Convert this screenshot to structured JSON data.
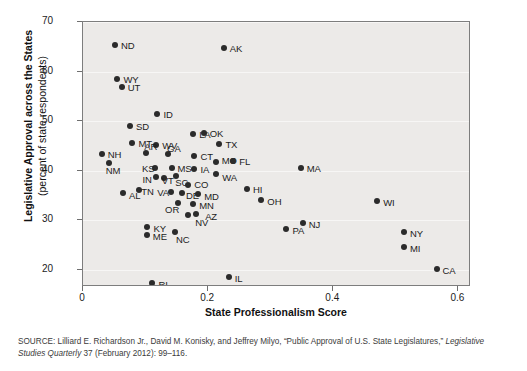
{
  "figure": {
    "xlabel": "State Professionalism Score",
    "ylabel_line1": "Legislative Approval across the States",
    "ylabel_line2": "(percent of state respondents)",
    "source_prefix": "SOURCE:",
    "source_text": " Lilliard E. Richardson Jr., David M. Konisky, and Jeffrey Milyo, “Public Approval of U.S. State Legislatures,” ",
    "source_italic": "Legislative Studies Quarterly",
    "source_suffix": " 37 (February 2012): 99–116.",
    "point_color": "#2b2b2b",
    "plot_background": "#eceae8",
    "border_color": "#7d7d7d"
  },
  "chart_data": {
    "type": "scatter",
    "title": "",
    "xlabel": "State Professionalism Score",
    "ylabel": "Legislative Approval across the States (percent of state respondents)",
    "xlim": [
      0.0,
      0.62
    ],
    "ylim": [
      16.5,
      70.0
    ],
    "xticks": [
      0,
      0.2,
      0.4,
      0.6
    ],
    "xticklabels": [
      "0",
      "0.2",
      "0.4",
      "0.6"
    ],
    "yticks": [
      20,
      30,
      40,
      50,
      60,
      70
    ],
    "yticklabels": [
      "20",
      "30",
      "40",
      "50",
      "60",
      "70"
    ],
    "grid": true,
    "legend": null,
    "points": [
      {
        "label": "ND",
        "x": 0.051,
        "y": 65.4,
        "lx": 6,
        "ly": -5
      },
      {
        "label": "AK",
        "x": 0.225,
        "y": 64.8,
        "lx": 6,
        "ly": -5
      },
      {
        "label": "WY",
        "x": 0.055,
        "y": 58.4,
        "lx": 6,
        "ly": -5
      },
      {
        "label": "UT",
        "x": 0.062,
        "y": 56.9,
        "lx": 6,
        "ly": -5
      },
      {
        "label": "ID",
        "x": 0.119,
        "y": 51.4,
        "lx": 6,
        "ly": -5
      },
      {
        "label": "SD",
        "x": 0.075,
        "y": 49.0,
        "lx": 6,
        "ly": -5
      },
      {
        "label": "LA",
        "x": 0.176,
        "y": 47.3,
        "lx": 6,
        "ly": -5
      },
      {
        "label": "OK",
        "x": 0.193,
        "y": 47.5,
        "lx": 6,
        "ly": -5
      },
      {
        "label": "TX",
        "x": 0.218,
        "y": 45.4,
        "lx": 6,
        "ly": -5
      },
      {
        "label": "MT",
        "x": 0.079,
        "y": 45.6,
        "lx": 6,
        "ly": -5
      },
      {
        "label": "WV",
        "x": 0.117,
        "y": 45.2,
        "lx": 6,
        "ly": -5
      },
      {
        "label": "NH",
        "x": 0.03,
        "y": 43.3,
        "lx": 6,
        "ly": -5
      },
      {
        "label": "AR",
        "x": 0.101,
        "y": 43.6,
        "lx": -2,
        "ly": -12
      },
      {
        "label": "GA",
        "x": 0.136,
        "y": 43.3,
        "lx": -1,
        "ly": -11
      },
      {
        "label": "CT",
        "x": 0.178,
        "y": 43.0,
        "lx": 6,
        "ly": -5
      },
      {
        "label": "MO",
        "x": 0.212,
        "y": 41.8,
        "lx": 6,
        "ly": -7
      },
      {
        "label": "FL",
        "x": 0.24,
        "y": 42.0,
        "lx": 6,
        "ly": -5
      },
      {
        "label": "NM",
        "x": 0.041,
        "y": 41.6,
        "lx": -3,
        "ly": 2
      },
      {
        "label": "KS",
        "x": 0.115,
        "y": 40.6,
        "lx": -13,
        "ly": -5
      },
      {
        "label": "MS",
        "x": 0.143,
        "y": 40.5,
        "lx": 5,
        "ly": -5
      },
      {
        "label": "IA",
        "x": 0.178,
        "y": 40.3,
        "lx": 6,
        "ly": -5
      },
      {
        "label": "WA",
        "x": 0.213,
        "y": 39.4,
        "lx": 6,
        "ly": -2
      },
      {
        "label": "IN",
        "x": 0.116,
        "y": 38.8,
        "lx": -13,
        "ly": -3
      },
      {
        "label": "VT",
        "x": 0.129,
        "y": 38.6,
        "lx": -2,
        "ly": -3
      },
      {
        "label": "SC",
        "x": 0.149,
        "y": 38.9,
        "lx": -1,
        "ly": 1
      },
      {
        "label": "MA",
        "x": 0.348,
        "y": 40.5,
        "lx": 6,
        "ly": -5
      },
      {
        "label": "CO",
        "x": 0.168,
        "y": 37.0,
        "lx": 6,
        "ly": -6
      },
      {
        "label": "HI",
        "x": 0.262,
        "y": 36.2,
        "lx": 6,
        "ly": -5
      },
      {
        "label": "AL",
        "x": 0.064,
        "y": 35.5,
        "lx": 6,
        "ly": -3
      },
      {
        "label": "TN",
        "x": 0.09,
        "y": 36.1,
        "lx": 2,
        "ly": -4
      },
      {
        "label": "VA",
        "x": 0.141,
        "y": 35.6,
        "lx": -14,
        "ly": 0
      },
      {
        "label": "DE",
        "x": 0.158,
        "y": 35.4,
        "lx": 4,
        "ly": -3
      },
      {
        "label": "MD",
        "x": 0.184,
        "y": 35.2,
        "lx": 6,
        "ly": -3
      },
      {
        "label": "OH",
        "x": 0.285,
        "y": 34.0,
        "lx": 6,
        "ly": -4
      },
      {
        "label": "WI",
        "x": 0.47,
        "y": 33.9,
        "lx": 6,
        "ly": -4
      },
      {
        "label": "OR",
        "x": 0.152,
        "y": 33.5,
        "lx": -13,
        "ly": 1
      },
      {
        "label": "MN",
        "x": 0.176,
        "y": 33.3,
        "lx": 6,
        "ly": -4
      },
      {
        "label": "AZ",
        "x": 0.168,
        "y": 31.0,
        "lx": 17,
        "ly": -4
      },
      {
        "label": "NV",
        "x": 0.181,
        "y": 31.2,
        "lx": -1,
        "ly": 3
      },
      {
        "label": "KY",
        "x": 0.103,
        "y": 28.6,
        "lx": 6,
        "ly": -4
      },
      {
        "label": "PA",
        "x": 0.325,
        "y": 28.3,
        "lx": 6,
        "ly": -4
      },
      {
        "label": "NJ",
        "x": 0.351,
        "y": 29.4,
        "lx": 6,
        "ly": -4
      },
      {
        "label": "NY",
        "x": 0.513,
        "y": 27.6,
        "lx": 6,
        "ly": -4
      },
      {
        "label": "MI",
        "x": 0.513,
        "y": 24.6,
        "lx": 6,
        "ly": -4
      },
      {
        "label": "ME",
        "x": 0.102,
        "y": 26.9,
        "lx": 6,
        "ly": -4
      },
      {
        "label": "NC",
        "x": 0.147,
        "y": 27.7,
        "lx": 1,
        "ly": 2
      },
      {
        "label": "IL",
        "x": 0.233,
        "y": 18.6,
        "lx": 6,
        "ly": -4
      },
      {
        "label": "RI",
        "x": 0.111,
        "y": 17.3,
        "lx": 6,
        "ly": -4
      },
      {
        "label": "CA",
        "x": 0.565,
        "y": 20.1,
        "lx": 6,
        "ly": -4
      }
    ]
  }
}
